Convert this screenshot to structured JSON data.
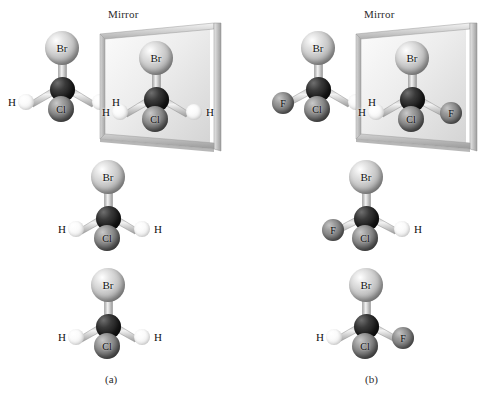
{
  "figure": {
    "background": "#ffffff",
    "mirror_label": "Mirror",
    "atom_colors": {
      "Br": "#c3c3c3",
      "Cl": "#777777",
      "F": "#7b7b7b",
      "H": "#f4f4f4",
      "C": "#1c1c1c"
    },
    "frame_color": "#b9b9b9",
    "glass_color": "#ededed"
  },
  "panels": [
    {
      "id": "a",
      "caption": "(a)",
      "mirror_label": "Mirror",
      "molecules": [
        {
          "role": "object",
          "name": "molecule-a-object",
          "atoms": {
            "top": "Br",
            "left": "H",
            "bottom": "Cl",
            "right": "H"
          }
        },
        {
          "role": "reflection",
          "name": "molecule-a-reflection",
          "atoms": {
            "top": "Br",
            "left": "H",
            "bottom": "Cl",
            "right": "H"
          }
        },
        {
          "role": "rotated",
          "name": "molecule-a-rotated",
          "atoms": {
            "top": "Br",
            "left": "H",
            "bottom": "Cl",
            "right": "H"
          }
        },
        {
          "role": "superimposed",
          "name": "molecule-a-superimposed",
          "atoms": {
            "top": "Br",
            "left": "H",
            "bottom": "Cl",
            "right": "H"
          }
        }
      ]
    },
    {
      "id": "b",
      "caption": "(b)",
      "mirror_label": "Mirror",
      "molecules": [
        {
          "role": "object",
          "name": "molecule-b-object",
          "atoms": {
            "top": "Br",
            "left": "F",
            "bottom": "Cl",
            "right": "H"
          }
        },
        {
          "role": "reflection",
          "name": "molecule-b-reflection",
          "atoms": {
            "top": "Br",
            "left": "H",
            "bottom": "Cl",
            "right": "F"
          }
        },
        {
          "role": "rotated",
          "name": "molecule-b-rotated",
          "atoms": {
            "top": "Br",
            "left": "F",
            "bottom": "Cl",
            "right": "H"
          }
        },
        {
          "role": "superimposed",
          "name": "molecule-b-superimposed",
          "atoms": {
            "top": "Br",
            "left": "H",
            "bottom": "Cl",
            "right": "F"
          }
        }
      ]
    }
  ]
}
